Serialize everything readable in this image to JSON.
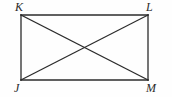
{
  "figure": {
    "kind": "geometry-diagram",
    "background_color": "#fefefe",
    "stroke_color": "#2b2b2b",
    "stroke_width": 1.3,
    "label_color": "#2b2b2b",
    "canvas": {
      "width": 172,
      "height": 97
    },
    "vertices": [
      {
        "id": "K",
        "label": "K",
        "x": 21,
        "y": 15,
        "position": "top-left"
      },
      {
        "id": "L",
        "label": "L",
        "x": 148,
        "y": 15,
        "position": "top-right"
      },
      {
        "id": "J",
        "label": "J",
        "x": 21,
        "y": 80,
        "position": "bottom-left"
      },
      {
        "id": "M",
        "label": "M",
        "x": 148,
        "y": 80,
        "position": "bottom-right"
      }
    ],
    "sides": [
      {
        "id": "KL",
        "from": "K",
        "to": "L"
      },
      {
        "id": "LM",
        "from": "L",
        "to": "M"
      },
      {
        "id": "MJ",
        "from": "M",
        "to": "J"
      },
      {
        "id": "JK",
        "from": "J",
        "to": "K"
      }
    ],
    "diagonals": [
      {
        "id": "KM",
        "from": "K",
        "to": "M"
      },
      {
        "id": "LJ",
        "from": "L",
        "to": "J"
      }
    ],
    "intersection": {
      "id": "center",
      "x": 84.5,
      "y": 47.5,
      "labeled": false
    }
  }
}
